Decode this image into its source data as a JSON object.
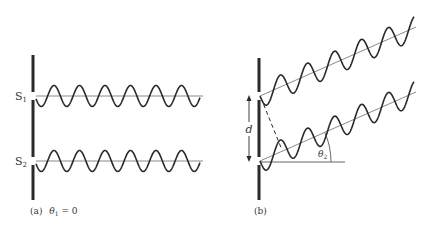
{
  "figure": {
    "panel_a": {
      "caption": "(a)",
      "angle_label_symbol": "θ",
      "angle_label_sub": "1",
      "angle_label_value": " = 0",
      "slit_labels": [
        {
          "text": "S",
          "sub": "1"
        },
        {
          "text": "S",
          "sub": "2"
        }
      ],
      "barrier": {
        "x": 33,
        "y_top": 55,
        "y_bottom": 200
      },
      "slits_y": [
        96,
        161
      ],
      "wave": {
        "x_start": 36,
        "x_end": 200,
        "axis_end": 203,
        "wavelength": 25.5,
        "amplitude": 10.5,
        "cycles": 6.4
      }
    },
    "panel_b": {
      "caption": "(b)",
      "separation_label": "d",
      "angle_label_symbol": "θ",
      "angle_label_sub": "2",
      "barrier": {
        "x": 259,
        "y_top": 58,
        "y_bottom": 200
      },
      "slits_y": [
        96,
        161
      ],
      "ray_end_x": 416,
      "ray_slope": -0.44,
      "wave": {
        "wavelength_x": 27,
        "amplitude": 12
      },
      "reference_line_end_x": 345
    },
    "colors": {
      "ink": "#2a2a2a",
      "axis": "#8a8a8a",
      "text": "#333333"
    }
  }
}
